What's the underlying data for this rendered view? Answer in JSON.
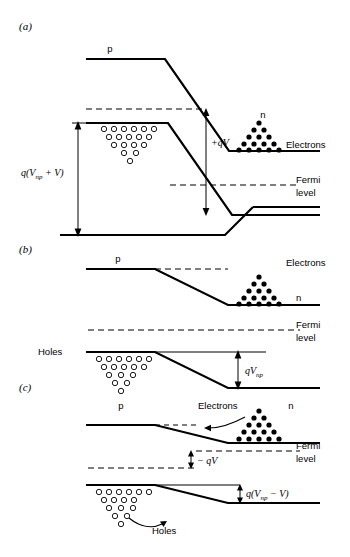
{
  "figure": {
    "background_color": "#ffffff",
    "line_color": "#000000"
  },
  "panels": [
    {
      "id": "a",
      "label": "(a)",
      "condition": "forward/reverse bias V applied",
      "labels": {
        "p_region": "p",
        "n_region": "n",
        "electrons": "Electrons",
        "fermi_line1": "Fermi",
        "fermi_line2": "level",
        "bias_drop": "+qV",
        "total_barrier_prefix": "q(V",
        "total_barrier_sub": "np",
        "total_barrier_suffix": " + V)"
      }
    },
    {
      "id": "b",
      "label": "(b)",
      "condition": "equilibrium, zero bias",
      "labels": {
        "p_region": "p",
        "n_region": "n",
        "electrons": "Electrons",
        "holes": "Holes",
        "fermi_line1": "Fermi",
        "fermi_line2": "level",
        "barrier_prefix": "qV",
        "barrier_sub": "np"
      }
    },
    {
      "id": "c",
      "label": "(c)",
      "condition": "forward bias, carrier injection",
      "labels": {
        "p_region": "p",
        "n_region": "n",
        "electrons": "Electrons",
        "holes": "Holes",
        "fermi_line1": "Fermi",
        "fermi_line2": "level",
        "bias_drop": "− qV",
        "barrier_prefix": "q(V",
        "barrier_sub": "np",
        "barrier_suffix": " − V)"
      }
    }
  ],
  "carriers": {
    "electron_symbol": "filled-circle",
    "hole_symbol": "open-circle",
    "electron_triangle_rows": [
      1,
      2,
      3,
      4,
      5
    ],
    "hole_triangle_rows": [
      6,
      5,
      4,
      2,
      1
    ]
  }
}
